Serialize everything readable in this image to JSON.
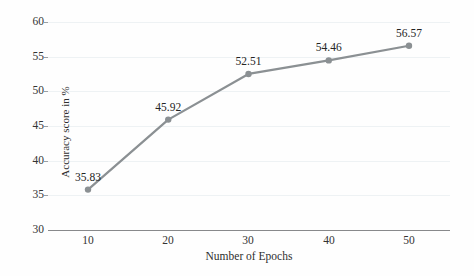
{
  "chart_data": {
    "type": "line",
    "title": "",
    "xlabel": "Number of Epochs",
    "ylabel": "Accuracy score in %",
    "categories": [
      10,
      20,
      30,
      40,
      50
    ],
    "x": [
      10,
      20,
      30,
      40,
      50
    ],
    "values": [
      35.83,
      45.92,
      52.51,
      54.46,
      56.57
    ],
    "point_labels": [
      "35.83",
      "45.92",
      "52.51",
      "54.46",
      "56.57"
    ],
    "series": [
      {
        "name": "Accuracy score in %",
        "values": [
          35.83,
          45.92,
          52.51,
          54.46,
          56.57
        ]
      }
    ],
    "xlim": [
      5,
      55
    ],
    "ylim": [
      30,
      60
    ],
    "xticks": [
      "10",
      "20",
      "30",
      "40",
      "50"
    ],
    "yticks": [
      "30",
      "35",
      "40",
      "45",
      "50",
      "55",
      "60"
    ],
    "grid": true,
    "legend": false,
    "legend_position": "none",
    "colors": {
      "line": "#8b9093",
      "marker": "#8b9093",
      "gridline": "#eef2f4",
      "axis": "#88898b",
      "text": "#2e2e2e",
      "background": "#fefefe"
    }
  },
  "axes": {
    "y_title": "Accuracy score in %",
    "x_title": "Number of Epochs",
    "y_ticks": [
      {
        "label": "60",
        "value": 60
      },
      {
        "label": "55",
        "value": 55
      },
      {
        "label": "50",
        "value": 50
      },
      {
        "label": "45",
        "value": 45
      },
      {
        "label": "40",
        "value": 40
      },
      {
        "label": "35",
        "value": 35
      },
      {
        "label": "30",
        "value": 30
      }
    ],
    "x_ticks": [
      {
        "label": "10",
        "value": 10
      },
      {
        "label": "20",
        "value": 20
      },
      {
        "label": "30",
        "value": 30
      },
      {
        "label": "40",
        "value": 40
      },
      {
        "label": "50",
        "value": 50
      }
    ]
  }
}
